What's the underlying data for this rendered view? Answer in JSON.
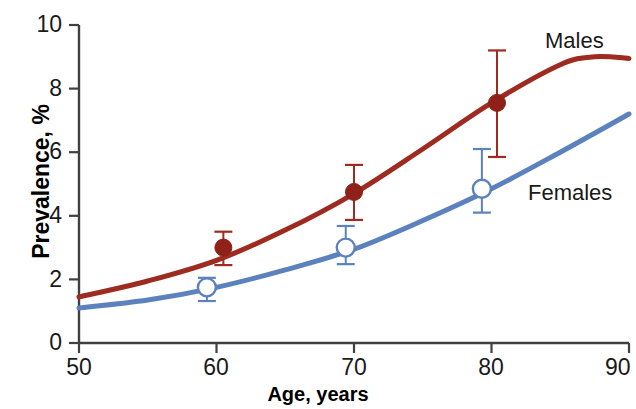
{
  "chart_data": {
    "type": "line",
    "title": "",
    "xlabel": "Age, years",
    "ylabel": "Prevalence, %",
    "xlim": [
      50,
      90
    ],
    "ylim": [
      0,
      10
    ],
    "xticks": [
      50,
      60,
      70,
      80,
      90
    ],
    "yticks": [
      0,
      2,
      4,
      6,
      8,
      10
    ],
    "grid": false,
    "legend_position": "inline-right",
    "series": [
      {
        "name": "Males",
        "color": "#9e2b20",
        "marker": "filled-circle",
        "curve_x": [
          50,
          55,
          60,
          65,
          70,
          75,
          80,
          85,
          87.5,
          90
        ],
        "curve_y": [
          1.45,
          1.95,
          2.6,
          3.55,
          4.7,
          6.1,
          7.55,
          8.75,
          9.0,
          8.95
        ],
        "points": [
          {
            "x": 60.5,
            "y": 3.0,
            "err_low": 2.45,
            "err_high": 3.5
          },
          {
            "x": 70.0,
            "y": 4.75,
            "err_low": 3.87,
            "err_high": 5.6
          },
          {
            "x": 80.4,
            "y": 7.55,
            "err_low": 5.85,
            "err_high": 9.2
          }
        ]
      },
      {
        "name": "Females",
        "color": "#5b82bd",
        "marker": "open-circle",
        "curve_x": [
          50,
          55,
          60,
          65,
          70,
          75,
          80,
          85,
          90
        ],
        "curve_y": [
          1.1,
          1.35,
          1.75,
          2.3,
          2.95,
          3.85,
          4.85,
          6.0,
          7.2
        ],
        "points": [
          {
            "x": 59.3,
            "y": 1.75,
            "err_low": 1.32,
            "err_high": 2.05
          },
          {
            "x": 69.4,
            "y": 3.0,
            "err_low": 2.48,
            "err_high": 3.68
          },
          {
            "x": 79.3,
            "y": 4.85,
            "err_low": 4.1,
            "err_high": 6.1
          }
        ]
      }
    ]
  },
  "axes": {
    "y_title": "Prevalence, %",
    "x_title": "Age, years",
    "y_tick_labels": [
      "10",
      "8",
      "6",
      "4",
      "2",
      "0"
    ],
    "x_tick_labels": [
      "50",
      "60",
      "70",
      "80",
      "90"
    ],
    "axis_color": "#404040"
  },
  "series_labels": {
    "males": "Males",
    "females": "Females"
  },
  "colors": {
    "males_line": "#9e2b20",
    "females_line": "#5b82bd",
    "males_marker_fill": "#8f2118",
    "females_marker_fill": "#ffffff",
    "background": "#ffffff",
    "text": "#1a1a1a"
  }
}
